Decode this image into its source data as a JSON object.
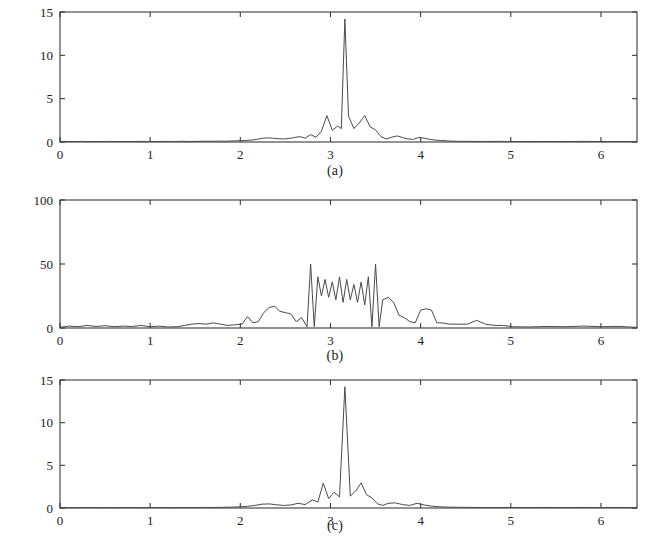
{
  "figure": {
    "background_color": "#ffffff",
    "line_color": "#4a4a4a",
    "axis_color": "#3a3a3a",
    "panel_count": 3
  },
  "chart_data": [
    {
      "type": "line",
      "panel_id": "a",
      "title": "",
      "caption": "(a)",
      "xlabel": "",
      "ylabel": "",
      "xlim": [
        0,
        6.4
      ],
      "ylim": [
        0,
        15
      ],
      "xticks": [
        0,
        1,
        2,
        3,
        4,
        5,
        6
      ],
      "xtick_labels": [
        "0",
        "1",
        "2",
        "3",
        "4",
        "5",
        "6"
      ],
      "yticks": [
        0,
        5,
        10,
        15
      ],
      "ytick_labels": [
        "0",
        "5",
        "10",
        "15"
      ],
      "grid": false,
      "legend": "none",
      "series": [
        {
          "name": "spectrum-a",
          "x": [
            0.0,
            0.08,
            0.16,
            0.24,
            0.32,
            0.4,
            0.48,
            0.56,
            0.64,
            0.72,
            0.8,
            0.88,
            0.96,
            1.04,
            1.12,
            1.2,
            1.28,
            1.36,
            1.44,
            1.52,
            1.6,
            1.68,
            1.76,
            1.84,
            1.92,
            2.0,
            2.06,
            2.12,
            2.18,
            2.24,
            2.3,
            2.36,
            2.42,
            2.48,
            2.54,
            2.6,
            2.66,
            2.72,
            2.78,
            2.84,
            2.9,
            2.96,
            3.02,
            3.08,
            3.12,
            3.16,
            3.2,
            3.26,
            3.32,
            3.38,
            3.44,
            3.5,
            3.56,
            3.62,
            3.68,
            3.74,
            3.8,
            3.86,
            3.92,
            3.98,
            4.04,
            4.1,
            4.16,
            4.22,
            4.3,
            4.4,
            4.55,
            4.7,
            4.85,
            5.0,
            5.2,
            5.4,
            5.6,
            5.8,
            6.0,
            6.2,
            6.4
          ],
          "y": [
            0.05,
            0.06,
            0.05,
            0.07,
            0.05,
            0.06,
            0.05,
            0.07,
            0.05,
            0.06,
            0.05,
            0.07,
            0.06,
            0.05,
            0.06,
            0.07,
            0.05,
            0.08,
            0.06,
            0.07,
            0.09,
            0.08,
            0.1,
            0.09,
            0.12,
            0.15,
            0.18,
            0.22,
            0.3,
            0.42,
            0.48,
            0.44,
            0.38,
            0.35,
            0.4,
            0.52,
            0.62,
            0.45,
            0.85,
            0.55,
            1.25,
            3.05,
            1.35,
            1.85,
            1.55,
            14.2,
            3.0,
            1.55,
            2.2,
            3.05,
            1.75,
            1.4,
            0.62,
            0.35,
            0.55,
            0.7,
            0.52,
            0.35,
            0.3,
            0.52,
            0.45,
            0.3,
            0.22,
            0.18,
            0.12,
            0.08,
            0.07,
            0.06,
            0.07,
            0.06,
            0.05,
            0.06,
            0.05,
            0.07,
            0.05,
            0.06,
            0.05
          ],
          "peak_x": 3.16,
          "peak_y": 14.2
        }
      ]
    },
    {
      "type": "line",
      "panel_id": "b",
      "title": "",
      "caption": "(b)",
      "xlabel": "",
      "ylabel": "",
      "xlim": [
        0,
        6.4
      ],
      "ylim": [
        0,
        100
      ],
      "xticks": [
        0,
        1,
        2,
        3,
        4,
        5,
        6
      ],
      "xtick_labels": [
        "0",
        "1",
        "2",
        "3",
        "4",
        "5",
        "6"
      ],
      "yticks": [
        0,
        50,
        100
      ],
      "ytick_labels": [
        "0",
        "50",
        "100"
      ],
      "grid": false,
      "legend": "none",
      "series": [
        {
          "name": "spectrum-b",
          "x": [
            0.0,
            0.1,
            0.2,
            0.3,
            0.4,
            0.5,
            0.6,
            0.7,
            0.8,
            0.9,
            1.0,
            1.1,
            1.2,
            1.3,
            1.38,
            1.46,
            1.54,
            1.62,
            1.7,
            1.78,
            1.86,
            1.94,
            2.02,
            2.08,
            2.14,
            2.2,
            2.26,
            2.32,
            2.38,
            2.44,
            2.5,
            2.56,
            2.62,
            2.68,
            2.74,
            2.78,
            2.82,
            2.86,
            2.9,
            2.94,
            2.98,
            3.02,
            3.06,
            3.1,
            3.14,
            3.18,
            3.22,
            3.26,
            3.3,
            3.34,
            3.38,
            3.42,
            3.46,
            3.5,
            3.54,
            3.58,
            3.64,
            3.7,
            3.76,
            3.82,
            3.88,
            3.94,
            4.0,
            4.06,
            4.12,
            4.18,
            4.24,
            4.32,
            4.42,
            4.52,
            4.62,
            4.72,
            4.82,
            4.92,
            5.02,
            5.2,
            5.4,
            5.6,
            5.8,
            6.0,
            6.2,
            6.4
          ],
          "y": [
            0.5,
            1.5,
            1.0,
            2.0,
            1.2,
            1.8,
            1.0,
            1.5,
            1.2,
            2.0,
            1.0,
            1.5,
            0.8,
            1.0,
            2.0,
            3.0,
            3.5,
            3.0,
            4.0,
            3.0,
            2.0,
            2.5,
            3.0,
            9.0,
            4.0,
            5.0,
            12.0,
            16.0,
            17.0,
            13.0,
            12.0,
            11.0,
            5.0,
            8.0,
            1.0,
            50.0,
            1.0,
            40.0,
            25.0,
            38.0,
            24.0,
            36.0,
            22.0,
            40.0,
            20.0,
            38.0,
            22.0,
            34.0,
            20.0,
            36.0,
            18.0,
            40.0,
            1.0,
            50.0,
            1.0,
            22.0,
            24.0,
            20.0,
            10.0,
            8.0,
            5.0,
            4.0,
            14.0,
            15.0,
            14.0,
            4.0,
            4.0,
            3.0,
            3.0,
            3.0,
            6.0,
            3.0,
            2.0,
            2.0,
            1.0,
            0.8,
            1.2,
            1.0,
            1.5,
            1.0,
            1.2,
            0.5
          ],
          "peak_x": 2.78,
          "peak_y": 50
        }
      ]
    },
    {
      "type": "line",
      "panel_id": "c",
      "title": "",
      "caption": "(c)",
      "xlabel": "",
      "ylabel": "",
      "xlim": [
        0,
        6.4
      ],
      "ylim": [
        0,
        15
      ],
      "xticks": [
        0,
        1,
        2,
        3,
        4,
        5,
        6
      ],
      "xtick_labels": [
        "0",
        "1",
        "2",
        "3",
        "4",
        "5",
        "6"
      ],
      "yticks": [
        0,
        5,
        10,
        15
      ],
      "ytick_labels": [
        "0",
        "5",
        "10",
        "15"
      ],
      "grid": false,
      "legend": "none",
      "series": [
        {
          "name": "spectrum-c",
          "x": [
            0.0,
            0.1,
            0.2,
            0.3,
            0.4,
            0.5,
            0.6,
            0.7,
            0.8,
            0.9,
            1.0,
            1.1,
            1.2,
            1.3,
            1.4,
            1.5,
            1.6,
            1.7,
            1.8,
            1.9,
            2.0,
            2.08,
            2.16,
            2.24,
            2.32,
            2.4,
            2.48,
            2.56,
            2.64,
            2.72,
            2.8,
            2.86,
            2.92,
            2.98,
            3.04,
            3.1,
            3.16,
            3.22,
            3.28,
            3.34,
            3.4,
            3.46,
            3.52,
            3.58,
            3.64,
            3.72,
            3.8,
            3.88,
            3.96,
            4.04,
            4.12,
            4.2,
            4.3,
            4.45,
            4.6,
            4.8,
            5.0,
            5.2,
            5.4,
            5.6,
            5.8,
            6.0,
            6.2,
            6.4
          ],
          "y": [
            0.04,
            0.05,
            0.04,
            0.06,
            0.04,
            0.05,
            0.04,
            0.06,
            0.05,
            0.04,
            0.05,
            0.06,
            0.04,
            0.05,
            0.06,
            0.05,
            0.07,
            0.06,
            0.08,
            0.1,
            0.14,
            0.2,
            0.3,
            0.45,
            0.48,
            0.38,
            0.3,
            0.35,
            0.55,
            0.4,
            0.95,
            0.7,
            2.9,
            1.1,
            1.85,
            1.3,
            14.2,
            1.4,
            2.0,
            2.95,
            1.55,
            1.2,
            0.5,
            0.3,
            0.55,
            0.6,
            0.4,
            0.3,
            0.55,
            0.35,
            0.22,
            0.15,
            0.1,
            0.08,
            0.06,
            0.05,
            0.06,
            0.05,
            0.06,
            0.05,
            0.06,
            0.05,
            0.06,
            0.04
          ],
          "peak_x": 3.16,
          "peak_y": 14.2
        }
      ]
    }
  ]
}
